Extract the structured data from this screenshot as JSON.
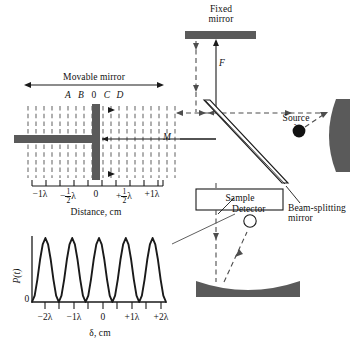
{
  "figure": {
    "type": "michelson-interferometer-schematic"
  },
  "colors": {
    "mirror_fill": "#5a5a5a",
    "line": "#1a1a1a",
    "background": "#ffffff"
  },
  "labels": {
    "fixed_mirror_line1": "Fixed",
    "fixed_mirror_line2": "mirror",
    "movable_mirror": "Movable mirror",
    "source_line1": "Source",
    "source_line2": "λ",
    "beam_splitter_line1": "Beam-splitting",
    "beam_splitter_line2": "mirror",
    "sample": "Sample",
    "detector": "Detector",
    "path_F": "F",
    "path_M": "M",
    "distance_axis_title": "Distance, cm",
    "delta_axis_title": "δ, cm",
    "power_axis": "P(t)",
    "power_zero": "0"
  },
  "mirror_positions": {
    "points": [
      "A",
      "B",
      "0",
      "C",
      "D"
    ],
    "x": [
      68,
      81,
      94,
      107,
      120
    ],
    "y": 96
  },
  "distance_axis": {
    "ticks": [
      {
        "label": "−1λ",
        "x": 40
      },
      {
        "label": "−½λ",
        "x": 67,
        "frac": true,
        "sign": "−",
        "num": "1",
        "den": "2",
        "unit": "λ"
      },
      {
        "label": "0",
        "x": 96
      },
      {
        "label": "+½λ",
        "x": 124,
        "frac": true,
        "sign": "+",
        "num": "1",
        "den": "2",
        "unit": "λ"
      },
      {
        "label": "+1λ",
        "x": 152
      }
    ],
    "axis_y": 186,
    "x_start": 32,
    "x_end": 163
  },
  "chart_data": {
    "type": "line",
    "title": "",
    "xlabel": "δ, cm",
    "ylabel": "P(t)",
    "xlim": [
      -2.5,
      2.5
    ],
    "ylim": [
      0,
      1
    ],
    "grid": false,
    "legend": null,
    "x_tick_labels": [
      "−2λ",
      "−1λ",
      "0",
      "+1λ",
      "+2λ"
    ],
    "x_tick_values": [
      -2,
      -1,
      0,
      1,
      2
    ],
    "x_minor_tick_values": [
      -1.5,
      -0.5,
      0.5,
      1.5
    ],
    "y_tick_labels": [
      "0"
    ],
    "y_tick_values": [
      0
    ],
    "x": [
      -2.5,
      -2.4,
      -2.3,
      -2.2,
      -2.1,
      -2.0,
      -1.9,
      -1.8,
      -1.7,
      -1.6,
      -1.5,
      -1.4,
      -1.3,
      -1.2,
      -1.1,
      -1.0,
      -0.9,
      -0.8,
      -0.7,
      -0.6,
      -0.5,
      -0.4,
      -0.3,
      -0.2,
      -0.1,
      0.0,
      0.1,
      0.2,
      0.3,
      0.4,
      0.5,
      0.6,
      0.7,
      0.8,
      0.9,
      1.0,
      1.1,
      1.2,
      1.3,
      1.4,
      1.5,
      1.6,
      1.7,
      1.8,
      1.9,
      2.0,
      2.1,
      2.2,
      2.3,
      2.4,
      2.5
    ],
    "y": [
      0.0,
      0.1,
      0.35,
      0.66,
      0.9,
      1.0,
      0.9,
      0.66,
      0.35,
      0.1,
      0.0,
      0.1,
      0.35,
      0.66,
      0.9,
      1.0,
      0.9,
      0.66,
      0.35,
      0.1,
      0.0,
      0.1,
      0.35,
      0.66,
      0.9,
      1.0,
      0.9,
      0.66,
      0.35,
      0.1,
      0.0,
      0.1,
      0.35,
      0.66,
      0.9,
      1.0,
      0.9,
      0.66,
      0.35,
      0.1,
      0.0,
      0.1,
      0.35,
      0.66,
      0.9,
      1.0,
      0.9,
      0.66,
      0.35,
      0.1,
      0.0
    ],
    "formula": "P(δ) = (1 + cos(2πδ/λ))/2",
    "peak_count": 5
  }
}
